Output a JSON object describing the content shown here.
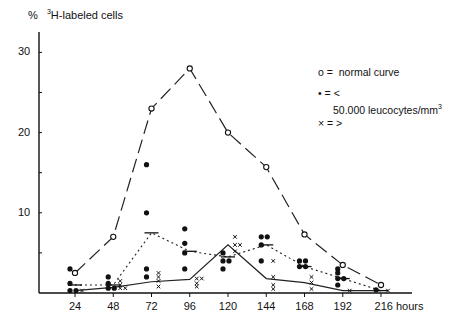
{
  "chart_data": {
    "type": "line",
    "title": "",
    "ylabel": "% 3H-labeled cells",
    "ylabel_prefix": "%",
    "ylabel_sup": "3",
    "ylabel_rest": "H-labeled cells",
    "xlabel": "hours",
    "x": [
      24,
      48,
      72,
      96,
      120,
      144,
      168,
      192,
      216
    ],
    "x_tick_labels": [
      "24",
      "48",
      "72",
      "96",
      "120",
      "144",
      "168",
      "192",
      "216 hours"
    ],
    "y_ticks": [
      10,
      20,
      30
    ],
    "ylim": [
      0,
      32
    ],
    "grid": false,
    "legend_position": "upper right",
    "legend": [
      {
        "marker": "o",
        "symbol": "o =",
        "label": "normal curve"
      },
      {
        "marker": "•",
        "symbol": "• = <",
        "label": "50.000 leucocytes/mm3"
      },
      {
        "marker": "x",
        "symbol": "× = >",
        "label": ""
      }
    ],
    "series": [
      {
        "name": "normal curve",
        "marker": "o",
        "line": "long-dash",
        "values": [
          2.5,
          7,
          23,
          28,
          20,
          15.7,
          7.3,
          3.5,
          1
        ]
      },
      {
        "name": "< 50.000 leucocytes/mm3 (mean)",
        "marker": "•",
        "line": "dotted",
        "values": [
          1,
          1,
          7.5,
          5.2,
          4.5,
          6,
          3.3,
          1.8,
          0.3
        ]
      },
      {
        "name": "> 50.000 leucocytes/mm3 (mean)",
        "marker": "x",
        "line": "solid",
        "values": [
          0.3,
          0.7,
          1.4,
          1.7,
          6,
          1.8,
          1.3,
          0.3,
          0.3
        ]
      }
    ],
    "scatter_points": {
      "dots": [
        [
          24,
          3
        ],
        [
          24,
          1.2
        ],
        [
          24,
          0.3
        ],
        [
          24,
          0.3
        ],
        [
          48,
          2
        ],
        [
          48,
          1.2
        ],
        [
          48,
          0.6
        ],
        [
          48,
          0.6
        ],
        [
          72,
          16
        ],
        [
          72,
          10
        ],
        [
          72,
          3
        ],
        [
          72,
          2
        ],
        [
          96,
          8
        ],
        [
          96,
          6.2
        ],
        [
          96,
          5
        ],
        [
          96,
          3
        ],
        [
          120,
          5
        ],
        [
          120,
          4
        ],
        [
          120,
          4
        ],
        [
          120,
          3
        ],
        [
          144,
          7
        ],
        [
          144,
          7
        ],
        [
          144,
          6
        ],
        [
          144,
          4
        ],
        [
          168,
          4
        ],
        [
          168,
          4
        ],
        [
          168,
          3.3
        ],
        [
          168,
          3.3
        ],
        [
          192,
          3
        ],
        [
          192,
          2.5
        ],
        [
          192,
          1.8
        ],
        [
          192,
          1.8
        ],
        [
          192,
          1
        ],
        [
          216,
          0.4
        ]
      ],
      "crosses": [
        [
          24,
          0.3
        ],
        [
          48,
          1.5
        ],
        [
          48,
          1
        ],
        [
          48,
          0.6
        ],
        [
          48,
          0.6
        ],
        [
          72,
          2.5
        ],
        [
          72,
          2
        ],
        [
          72,
          1.5
        ],
        [
          72,
          0.8
        ],
        [
          96,
          1.8
        ],
        [
          96,
          1.8
        ],
        [
          96,
          1.2
        ],
        [
          96,
          0.8
        ],
        [
          120,
          7
        ],
        [
          120,
          6
        ],
        [
          120,
          6
        ],
        [
          120,
          5.2
        ],
        [
          144,
          4
        ],
        [
          144,
          2
        ],
        [
          144,
          1
        ],
        [
          144,
          0.5
        ],
        [
          168,
          2
        ],
        [
          168,
          1.3
        ],
        [
          168,
          0.5
        ],
        [
          192,
          0.3
        ],
        [
          216,
          0.3
        ]
      ]
    }
  }
}
